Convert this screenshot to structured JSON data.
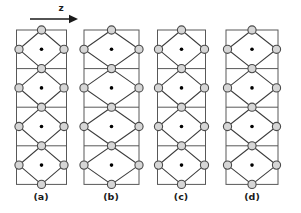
{
  "figure": {
    "title": "",
    "background_color": "#ffffff",
    "width": 301,
    "height": 213
  },
  "axis": {
    "label": "z",
    "direction": "right",
    "arrow_name": "z-axis-arrow",
    "line": {
      "x1": 30,
      "y1": 19,
      "x2": 78,
      "y2": 19
    },
    "label_pos": {
      "x": 61,
      "y": 11
    }
  },
  "colors": {
    "atom_fill": "#d6d6d6",
    "atom_stroke": "#4a4a4a",
    "center_dot": "#000000",
    "cell_stroke": "#585858",
    "bond_stroke": "#3c3c3c",
    "text": "#1a1a1a"
  },
  "geometry": {
    "atom_radius": 4.1,
    "center_dot_radius": 1.8,
    "cell_top": 30,
    "cell_height": 38.6,
    "cells_per_panel": 4
  },
  "panels": [
    {
      "id": "panel-a",
      "label": "(a)",
      "label_pos": {
        "x": 41,
        "y": 200
      },
      "cx": 41.5,
      "half_width": 25.0,
      "side_node_inset": 2.5,
      "top": 30,
      "cell_height": 38.6,
      "cells": 4,
      "description": "narrow cell, side atoms just inside vertical edges"
    },
    {
      "id": "panel-b",
      "label": "(b)",
      "label_pos": {
        "x": 111,
        "y": 200
      },
      "cx": 111.5,
      "half_width": 27.5,
      "side_node_inset": 0.0,
      "top": 30,
      "cell_height": 38.6,
      "cells": 4,
      "description": "wider cell, side atoms centered on vertical edges"
    },
    {
      "id": "panel-c",
      "label": "(c)",
      "label_pos": {
        "x": 181,
        "y": 200
      },
      "cx": 181.5,
      "half_width": 24.0,
      "side_node_inset": 1.0,
      "top": 30,
      "cell_height": 38.6,
      "cells": 4,
      "description": "narrow cell, side atoms on vertical edges"
    },
    {
      "id": "panel-d",
      "label": "(d)",
      "label_pos": {
        "x": 252,
        "y": 200
      },
      "cx": 252.0,
      "half_width": 26.0,
      "side_node_inset": 1.5,
      "top": 30,
      "cell_height": 38.6,
      "cells": 4,
      "description": "medium cell, side atoms on vertical edges"
    }
  ],
  "legend": {
    "atom_large": "shaded circle (framework atom)",
    "atom_small": "black dot (interstitial / cation site)"
  }
}
